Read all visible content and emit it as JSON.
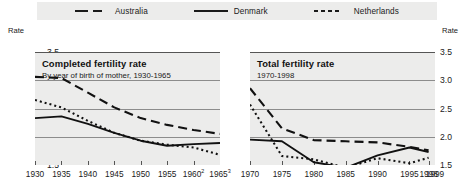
{
  "legend": {
    "items": [
      {
        "label": "Australia",
        "style": "dashed"
      },
      {
        "label": "Denmark",
        "style": "solid"
      },
      {
        "label": "Netherlands",
        "style": "dotted"
      }
    ]
  },
  "axis": {
    "rate_caption": "Rate",
    "yticks": [
      "3.5",
      "3.0",
      "2.5",
      "2.0",
      "1.5"
    ]
  },
  "chart_data": [
    {
      "type": "line",
      "panel": "left",
      "title": "Completed fertility rate",
      "subtitle": "By year of birth of mother, 1930-1965",
      "xlabel": "",
      "ylabel": "Rate",
      "ylim": [
        1.5,
        3.5
      ],
      "xlim": [
        1930,
        1965
      ],
      "grid": true,
      "legend_position": "top",
      "xticks": [
        1930,
        1935,
        1940,
        1945,
        1950,
        1955,
        1960,
        1965
      ],
      "xticklabels": [
        "1930",
        "1935",
        "1940",
        "1945",
        "1950",
        "1955",
        "1960",
        "1965"
      ],
      "xtick_footnotes": {
        "1960": "2",
        "1965": "3"
      },
      "yticks": [
        1.5,
        2.0,
        2.5,
        3.0,
        3.5
      ],
      "series": [
        {
          "name": "Australia",
          "style": "dashed",
          "x": [
            1930,
            1935,
            1940,
            1945,
            1950,
            1955,
            1960,
            1965
          ],
          "values": [
            3.06,
            3.04,
            2.78,
            2.52,
            2.33,
            2.21,
            2.12,
            2.05
          ]
        },
        {
          "name": "Denmark",
          "style": "solid",
          "x": [
            1930,
            1935,
            1940,
            1945,
            1950,
            1955,
            1960,
            1965
          ],
          "values": [
            2.33,
            2.36,
            2.23,
            2.07,
            1.93,
            1.84,
            1.87,
            1.89
          ]
        },
        {
          "name": "Netherlands",
          "style": "dotted",
          "x": [
            1930,
            1935,
            1940,
            1945,
            1950,
            1955,
            1960,
            1965
          ],
          "values": [
            2.65,
            2.52,
            2.28,
            2.07,
            1.93,
            1.86,
            1.81,
            1.68
          ]
        }
      ]
    },
    {
      "type": "line",
      "panel": "right",
      "title": "Total fertility rate",
      "subtitle": "1970-1998",
      "xlabel": "",
      "ylabel": "Rate",
      "ylim": [
        1.5,
        3.5
      ],
      "xlim": [
        1970,
        1999
      ],
      "grid": true,
      "legend_position": "top",
      "xticks": [
        1970,
        1975,
        1980,
        1985,
        1990,
        1995,
        1998,
        1999
      ],
      "xticklabels": [
        "1970",
        "1975",
        "1980",
        "1985",
        "1990",
        "1995",
        "1998",
        "1999"
      ],
      "yticks": [
        1.5,
        2.0,
        2.5,
        3.0,
        3.5
      ],
      "series": [
        {
          "name": "Australia",
          "style": "dashed",
          "x": [
            1970,
            1975,
            1980,
            1985,
            1990,
            1995,
            1998
          ],
          "values": [
            2.86,
            2.15,
            1.94,
            1.92,
            1.9,
            1.82,
            1.76
          ]
        },
        {
          "name": "Denmark",
          "style": "solid",
          "x": [
            1970,
            1975,
            1980,
            1985,
            1990,
            1995,
            1998
          ],
          "values": [
            1.95,
            1.92,
            1.55,
            1.45,
            1.67,
            1.81,
            1.73
          ]
        },
        {
          "name": "Netherlands",
          "style": "dotted",
          "x": [
            1970,
            1975,
            1980,
            1985,
            1990,
            1995,
            1998
          ],
          "values": [
            2.57,
            1.66,
            1.6,
            1.45,
            1.62,
            1.53,
            1.63
          ]
        }
      ]
    }
  ]
}
